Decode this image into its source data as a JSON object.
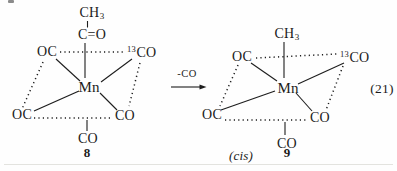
{
  "scheme": {
    "equation_number": "(21)",
    "arrow": {
      "label": "-CO"
    },
    "structures": [
      {
        "compound_number": "8",
        "metal": "Mn",
        "apical": {
          "methyl_base": "CH",
          "methyl_sub": "3",
          "acyl": "C=O"
        },
        "ligands": {
          "upper_left": "OC",
          "upper_right_sup": "13",
          "upper_right": "CO",
          "lower_left": "OC",
          "lower_right": "CO",
          "bottom": "CO"
        }
      },
      {
        "compound_number": "9",
        "isomer": "(cis)",
        "metal": "Mn",
        "apical": {
          "methyl_base": "CH",
          "methyl_sub": "3"
        },
        "ligands": {
          "upper_left": "OC",
          "upper_right_sup": "13",
          "upper_right": "CO",
          "lower_left": "OC",
          "lower_right": "CO",
          "bottom": "CO"
        }
      }
    ]
  }
}
